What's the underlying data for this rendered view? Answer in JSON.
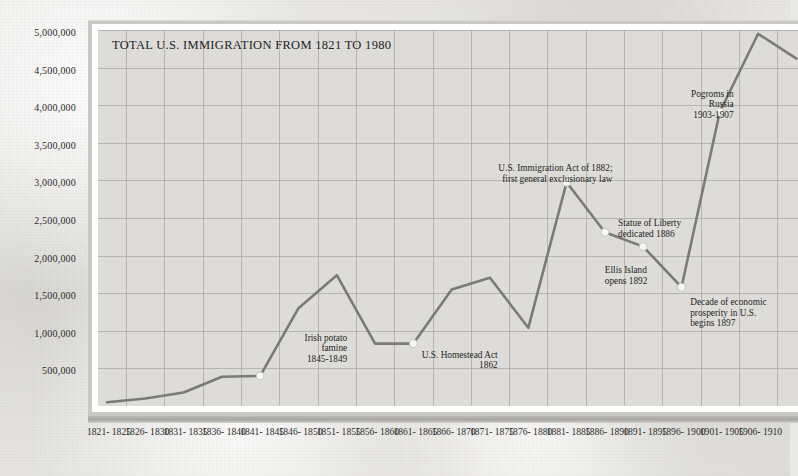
{
  "chart_data": {
    "type": "line",
    "title": "TOTAL U.S. IMMIGRATION FROM 1821 TO 1980",
    "xlabel": "",
    "ylabel": "",
    "ylim": [
      0,
      5000000
    ],
    "grid": true,
    "legend_position": "none",
    "y_ticks": [
      "500,000",
      "1,000,000",
      "1,500,000",
      "2,000,000",
      "2,500,000",
      "3,000,000",
      "3,500,000",
      "4,000,000",
      "4,500,000",
      "5,000,000"
    ],
    "y_tick_values": [
      500000,
      1000000,
      1500000,
      2000000,
      2500000,
      3000000,
      3500000,
      4000000,
      4500000,
      5000000
    ],
    "categories": [
      "1821-\n1825",
      "1826-\n1830",
      "1831-\n1835",
      "1836-\n1840",
      "1841-\n1845",
      "1846-\n1850",
      "1851-\n1855",
      "1856-\n1860",
      "1861-\n1865",
      "1866-\n1870",
      "1871-\n1875",
      "1876-\n1880",
      "1881-\n1885",
      "1886-\n1890",
      "1891-\n1895",
      "1896-\n1900",
      "1901-\n1905",
      "1906-\n1910"
    ],
    "values": [
      50000,
      100000,
      180000,
      390000,
      400000,
      1300000,
      1740000,
      830000,
      830000,
      1550000,
      1705000,
      1040000,
      2975000,
      2310000,
      2120000,
      1580000,
      3910000,
      4950000
    ],
    "markers": [
      {
        "category_index": 4,
        "value": 400000
      },
      {
        "category_index": 8,
        "value": 830000
      },
      {
        "category_index": 12,
        "value": 2975000
      },
      {
        "category_index": 13,
        "value": 2310000
      },
      {
        "category_index": 14,
        "value": 2120000
      },
      {
        "category_index": 15,
        "value": 1580000
      },
      {
        "category_index": 16,
        "value": 3910000
      }
    ],
    "annotations": [
      {
        "id": "irish-famine",
        "text": "Irish potato\nfamine\n1845-1849",
        "align": "right",
        "x_pct": 35.6,
        "y_pct": 80.5
      },
      {
        "id": "homestead-act",
        "text": "U.S. Homestead Act\n1862",
        "align": "right",
        "x_pct": 57.1,
        "y_pct": 85.0
      },
      {
        "id": "immigration-act",
        "text": "U.S. Immigration Act of 1882;\nfirst general exclusionary law",
        "align": "right",
        "x_pct": 73.5,
        "y_pct": 35.4
      },
      {
        "id": "statue-of-liberty",
        "text": "Statue of Liberty\ndedicated 1886",
        "align": "left",
        "x_pct": 74.3,
        "y_pct": 50.1
      },
      {
        "id": "ellis-island",
        "text": "Ellis Island\nopens 1892",
        "align": "left",
        "x_pct": 72.4,
        "y_pct": 62.6
      },
      {
        "id": "pogroms-russia",
        "text": "Pogroms in\nRussia\n1903-1907",
        "align": "right",
        "x_pct": 90.8,
        "y_pct": 15.6
      },
      {
        "id": "economic-prosperity",
        "text": "Decade of economic\nprosperity in U.S.\nbegins 1897",
        "align": "left",
        "x_pct": 84.6,
        "y_pct": 71.0
      }
    ],
    "colors": {
      "line": "#7b7a77",
      "marker_fill": "#f7f7f5",
      "plot_background": "#dddcd8",
      "gridline": "#a9a8a4",
      "frame": "#c9c8c4",
      "text": "#26241f",
      "page_background": "#eae9e6"
    }
  }
}
